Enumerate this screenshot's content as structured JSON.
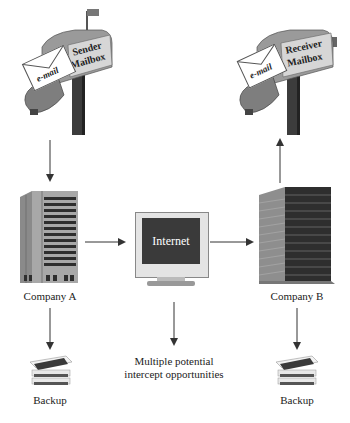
{
  "sender_mailbox": {
    "flag_label": "Sender Mailbox",
    "line1": "Sender",
    "line2": "Mailbox",
    "envelope_label": "e-mail"
  },
  "receiver_mailbox": {
    "line1": "Receiver",
    "line2": "Mailbox",
    "envelope_label": "e-mail"
  },
  "company_a": {
    "label": "Company A"
  },
  "company_b": {
    "label": "Company B"
  },
  "internet": {
    "screen_label": "Internet"
  },
  "intercept": {
    "label": "Multiple potential intercept opportunities"
  },
  "backup_a": {
    "label": "Backup"
  },
  "backup_b": {
    "label": "Backup"
  },
  "colors": {
    "arrow": "#333333",
    "screen": "#3a3a3a",
    "building_light": "#9a9a9a",
    "building_dark": "#3c3c3c",
    "mailbox": "#8c8c8c"
  }
}
